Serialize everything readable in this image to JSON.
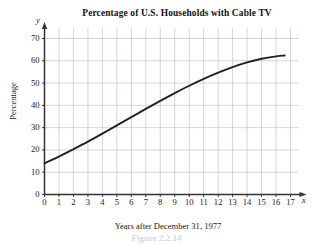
{
  "figure": {
    "title": "Percentage of U.S. Households with Cable TV",
    "caption": "Figure 2.2.14",
    "y_axis_letter": "y",
    "x_axis_letter": "x",
    "ylabel": "Percentage",
    "xlabel": "Years after December 31, 1977",
    "colors": {
      "curve": "#222222",
      "axis": "#333333",
      "grid": "#b9c3d6",
      "background": "#ffffff",
      "text": "#1a1a1a"
    }
  },
  "chart_data": {
    "type": "line",
    "title": "Percentage of U.S. Households with Cable TV",
    "xlabel": "Years after December 31, 1977",
    "ylabel": "Percentage",
    "xlim": [
      0,
      17
    ],
    "ylim": [
      0,
      75
    ],
    "xticks": [
      "0",
      "1",
      "2",
      "3",
      "4",
      "5",
      "6",
      "7",
      "8",
      "9",
      "10",
      "11",
      "12",
      "13",
      "14",
      "15",
      "16",
      "17"
    ],
    "yticks": [
      "0",
      "10",
      "20",
      "30",
      "40",
      "50",
      "60",
      "70"
    ],
    "ytick_values": [
      0,
      10,
      20,
      30,
      40,
      50,
      60,
      70
    ],
    "grid": true,
    "legend": false,
    "series": [
      {
        "name": "Percentage of U.S. households with cable TV",
        "x": [
          0,
          1,
          2,
          3,
          4,
          5,
          6,
          7,
          8,
          9,
          10,
          11,
          12,
          13,
          14,
          15,
          16,
          16.6
        ],
        "values": [
          14.0,
          17.0,
          20.3,
          23.7,
          27.3,
          31.0,
          34.7,
          38.4,
          42.0,
          45.5,
          48.8,
          51.9,
          54.7,
          57.2,
          59.3,
          60.9,
          62.0,
          62.4
        ]
      }
    ]
  }
}
